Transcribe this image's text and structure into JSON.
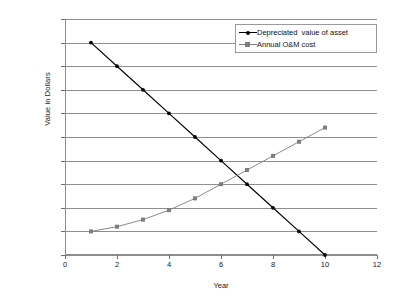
{
  "chart_data": {
    "type": "line",
    "title": "",
    "xlabel": "Year",
    "ylabel": "Value in Dollars",
    "xlim": [
      0,
      12
    ],
    "ylim": [
      0,
      100000
    ],
    "x_ticks": [
      0,
      2,
      4,
      6,
      8,
      10,
      12
    ],
    "x_tick_labels": [
      "0",
      "2",
      "4",
      "6",
      "8",
      "10",
      "12"
    ],
    "y_ticks": [
      0,
      10000,
      20000,
      30000,
      40000,
      50000,
      60000,
      70000,
      80000,
      90000,
      100000
    ],
    "y_tick_labels": [
      "0",
      "10,000",
      "20,000",
      "30,000",
      "40,000",
      "50,000",
      "60,000",
      "70,000",
      "80,000",
      "90,000",
      "100,000"
    ],
    "grid": "horizontal",
    "legend_position": "top-right",
    "x": [
      1,
      2,
      3,
      4,
      5,
      6,
      7,
      8,
      9,
      10
    ],
    "series": [
      {
        "name": "Depreciated  value of asset",
        "color": "#000000",
        "marker": "diamond",
        "values": [
          90000,
          80000,
          70000,
          60000,
          50000,
          40000,
          30000,
          20000,
          10000,
          0
        ]
      },
      {
        "name": "Annual O&M cost",
        "color": "#7d7d7d",
        "marker": "square",
        "values": [
          10000,
          12000,
          15000,
          19000,
          24000,
          30000,
          36000,
          42000,
          48000,
          54000
        ]
      }
    ]
  },
  "legend": {
    "items": [
      {
        "label": "Depreciated  value of asset"
      },
      {
        "label": "Annual O&M cost"
      }
    ]
  },
  "axes": {
    "y_title": "Value in Dollars",
    "x_title": "Year"
  },
  "colors": {
    "series1": "#000000",
    "series2": "#7d7d7d",
    "grid": "#8f8f8f",
    "frame": "#8c8c8c",
    "background": "#ffffff",
    "text": "#151515"
  }
}
